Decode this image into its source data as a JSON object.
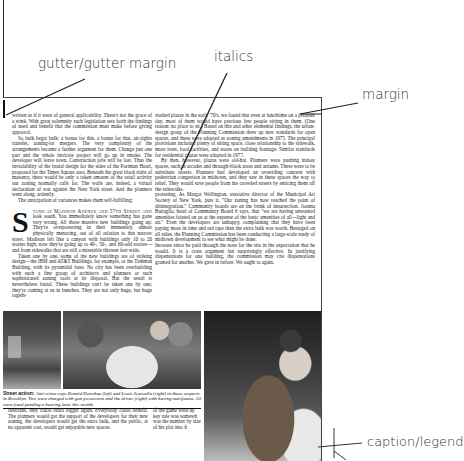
{
  "annotations": {
    "gutter": "gutter/gutter margin",
    "italics": "italics",
    "margin": "margin",
    "caption": "caption/legend"
  },
  "article": {
    "col_a": {
      "p1": "written as if it were of general applicability. There's not the grace of a wink. With great solemnity such legislation sets forth the findings of need and benefit that the commission must make before giving approval.",
      "p2": "So bulk begat bulk: a bonus for this, a bonus for that, air-rights transfer, zoning-lot mergers. The very complexity of the arrangements became a further argument for them. Change just one part and the whole intricate project will go up in smoke. The developer will leave town. Construction jobs will be lost. Thus the inviolability of the brutal design for the sides of the Portman Hotel, proposed for the Times Square area. Beneath the great black slabs of masonry, there would be only a token amount of the retail activity our zoning normally calls for. The walls are, indeed, a virtual declaration of war against the New York street. And the planners went along, ardently.",
      "p3": "The anticipation of variances makes them self-fulfilling:",
      "dropcap": "S",
      "p4_lead": "tand at Madison Avenue and 57th Street and",
      "p4": "look south. You immediately know something has gone very wrong. All those massive new buildings going up: They're overpowering in their immensity, almost physically menacing, out of all relation to this narrow street. Madison felt like a canyon with buildings only 10 to 20 stories high; now they're going up to 40-, 50-, and 60-odd stories—and from sidewalks that are still a miserable thirteen feet wide.",
      "p5": "Taken one by one, some of the new buildings are of striking design—the IBM and AT&T Buildings, for example, or the Tishman Building, with its pyramidal base. No city has been overbuilding with such a fine group of architects and planners or such sophisticated zoning tools at its disposal. But the result is nevertheless brutal. These buildings can't be taken one by one; they're coming at us in bunches. They are not only huge, but huge togeth-"
    },
    "col_b": {
      "p1": "studied plazas in the early '70's, we found that even at lunchtime on a pleasant day, most of them would have precious few people sitting in them. (One reason: no place to sit.) Based on this and other elemental findings, the urban-design group of the Planning Commission drew up new standards for open spaces, and these were adopted as zoning amendments in 1975. The principal provisions included plenty of sitting space, close relationship to the sidewalk, more trees, food facilities, and stores on building frontage. Similar standards for residential plazas were adopted in 1977.",
      "p2": "By then, however, plazas were old-hat. Planners were pushing indoor spaces, such as arcades and through-block areas and atriums. These were to be substitute streets. Planners had developed an overriding concern with pedestrian congestion in midtown, and they saw in these spaces the way to relief. They would save people from the crowded streets by enticing them off the sidewalks.",
      "p3": "protesting. As Margot Wellington, executive director of the Municipal Art Society of New York, puts it, \"Our zoning has now reached the point of disintegration.\" Community boards are on the brink of insurrection. Joanna Battaglia, head of Community Board 6 says, that \"we are having unwanted amenities foisted on us at the expense of the basic amenities of all—light and air.\" Even the developers are unhappy, complaining that they have been paying more in time and red tape than the extra bulk was worth. Besieged on all sides, the Planning Commission has been conducting a large-scale study of midtown development to see what might be done.",
      "p4": "Increase since he paid through the nose for the site in the expectation that he would. It is a crass argument but surprisingly effective. In justifying dispensations for one building, the commission may cite dispensations granted for another. We gave in before. We ought to again."
    },
    "caption": {
      "lead": "Street action:",
      "text": "Anti-crime cops Ronald Donohue (left) and Louis Scarcella (right) in these suspects in Brooklyn. Two were charged with gun possession and the driver (right) with having marijuana. All were freed pending a hearing later this month."
    },
    "col_c": {
      "p1": "destrians, they could build bigger again. Everybody could benefit. The planners would get the support of the developers for their new zoning, the developers would get the extra bulk, and the public, at no apparent cost, would get enjoyable new spaces."
    },
    "col_d": {
      "p1": "of the game were up key rule was somewh was the number by size of his plot into ft"
    }
  }
}
